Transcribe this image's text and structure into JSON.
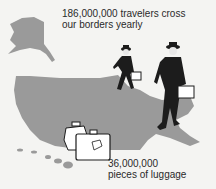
{
  "captions": {
    "top_line1": "186,000,000 travelers cross",
    "top_line2": "our borders yearly",
    "bottom_line1": "36,000,000",
    "bottom_line2": "pieces of luggage"
  },
  "colors": {
    "background": "#f4f4f2",
    "map": "#9a9a9a",
    "ink": "#1c1c1c",
    "luggage": "#ffffff"
  }
}
